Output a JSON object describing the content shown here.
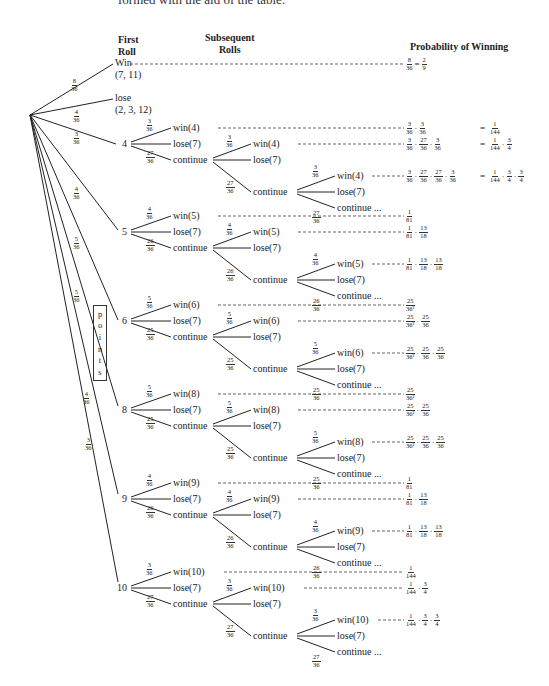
{
  "caption_fragment": "formed with the aid of the table.",
  "headers": {
    "first_roll": [
      "First",
      "Roll"
    ],
    "subsequent_rolls": [
      "Subsequent",
      "Rolls"
    ],
    "probability": "Probability of Winning"
  },
  "root_branches": [
    {
      "label": "Win",
      "sub": "(7, 11)",
      "p": [
        "8",
        "36"
      ],
      "result": {
        "frac": [
          [
            "8",
            "36"
          ]
        ],
        "eq": [
          "2",
          "9"
        ]
      }
    },
    {
      "label": "lose",
      "sub": "(2, 3, 12)",
      "p": [
        "4",
        "36"
      ]
    },
    {
      "label": "4",
      "p": [
        "3",
        "36"
      ]
    },
    {
      "label": "5",
      "p": [
        "4",
        "36"
      ]
    },
    {
      "label": "6",
      "p": [
        "5",
        "36"
      ]
    },
    {
      "label": "8",
      "p": [
        "5",
        "36"
      ]
    },
    {
      "label": "9",
      "p": [
        "4",
        "36"
      ]
    },
    {
      "label": "10",
      "p": [
        "3",
        "36"
      ]
    }
  ],
  "points_label": [
    "p",
    "o",
    "i",
    "n",
    "t",
    "s"
  ],
  "point_trees": [
    {
      "point": "4",
      "win": "win(4)",
      "lose": "lose(7)",
      "cont": "continue",
      "cont_more": "continue ...",
      "pw": [
        "3",
        "36"
      ],
      "pl": [
        "6",
        "36"
      ],
      "pc": [
        "27",
        "36"
      ],
      "probs": [
        {
          "terms": [
            [
              "3",
              "36"
            ],
            [
              "3",
              "36"
            ]
          ],
          "eq": [
            [
              "1",
              "144"
            ]
          ]
        },
        {
          "terms": [
            [
              "3",
              "36"
            ],
            [
              "27",
              "36"
            ],
            [
              "3",
              "36"
            ]
          ],
          "eq": [
            [
              "1",
              "144"
            ],
            [
              "3",
              "4"
            ]
          ]
        },
        {
          "terms": [
            [
              "3",
              "36"
            ],
            [
              "27",
              "36"
            ],
            [
              "27",
              "36"
            ],
            [
              "3",
              "36"
            ]
          ],
          "eq": [
            [
              "1",
              "144"
            ],
            [
              "3",
              "4"
            ],
            [
              "3",
              "4"
            ]
          ]
        }
      ]
    },
    {
      "point": "5",
      "win": "win(5)",
      "lose": "lose(7)",
      "cont": "continue",
      "cont_more": "continue ...",
      "pw": [
        "4",
        "36"
      ],
      "pl": [
        "6",
        "36"
      ],
      "pc": [
        "26",
        "36"
      ],
      "probs": [
        {
          "terms": [
            [
              "1",
              "81"
            ]
          ]
        },
        {
          "terms": [
            [
              "1",
              "81"
            ],
            [
              "13",
              "18"
            ]
          ]
        },
        {
          "terms": [
            [
              "1",
              "81"
            ],
            [
              "13",
              "18"
            ],
            [
              "13",
              "18"
            ]
          ]
        }
      ]
    },
    {
      "point": "6",
      "win": "win(6)",
      "lose": "lose(7)",
      "cont": "continue",
      "cont_more": "continue ...",
      "pw": [
        "5",
        "36"
      ],
      "pl": [
        "6",
        "36"
      ],
      "pc": [
        "25",
        "36"
      ],
      "probs": [
        {
          "terms": [
            [
              "25",
              "36²"
            ]
          ]
        },
        {
          "terms": [
            [
              "25",
              "36²"
            ],
            [
              "25",
              "36"
            ]
          ]
        },
        {
          "terms": [
            [
              "25",
              "36²"
            ],
            [
              "25",
              "36"
            ],
            [
              "25",
              "36"
            ]
          ]
        }
      ]
    },
    {
      "point": "8",
      "win": "win(8)",
      "lose": "lose(7)",
      "cont": "continue",
      "cont_more": "continue ...",
      "pw": [
        "5",
        "36"
      ],
      "pl": [
        "6",
        "36"
      ],
      "pc": [
        "25",
        "36"
      ],
      "probs": [
        {
          "terms": [
            [
              "25",
              "36²"
            ]
          ]
        },
        {
          "terms": [
            [
              "25",
              "36²"
            ],
            [
              "25",
              "36"
            ]
          ]
        },
        {
          "terms": [
            [
              "25",
              "36²"
            ],
            [
              "25",
              "36"
            ],
            [
              "25",
              "36"
            ]
          ]
        }
      ]
    },
    {
      "point": "9",
      "win": "win(9)",
      "lose": "lose(7)",
      "cont": "continue",
      "cont_more": "continue ...",
      "pw": [
        "4",
        "36"
      ],
      "pl": [
        "6",
        "36"
      ],
      "pc": [
        "26",
        "36"
      ],
      "probs": [
        {
          "terms": [
            [
              "1",
              "81"
            ]
          ]
        },
        {
          "terms": [
            [
              "1",
              "81"
            ],
            [
              "13",
              "18"
            ]
          ]
        },
        {
          "terms": [
            [
              "1",
              "81"
            ],
            [
              "13",
              "18"
            ],
            [
              "13",
              "18"
            ]
          ]
        }
      ]
    },
    {
      "point": "10",
      "win": "win(10)",
      "lose": "lose(7)",
      "cont": "continue",
      "cont_more": "continue ...",
      "pw": [
        "3",
        "36"
      ],
      "pl": [
        "6",
        "36"
      ],
      "pc": [
        "27",
        "36"
      ],
      "probs": [
        {
          "terms": [
            [
              "1",
              "144"
            ]
          ]
        },
        {
          "terms": [
            [
              "1",
              "144"
            ],
            [
              "3",
              "4"
            ]
          ]
        },
        {
          "terms": [
            [
              "1",
              "144"
            ],
            [
              "3",
              "4"
            ],
            [
              "3",
              "4"
            ]
          ]
        }
      ]
    }
  ]
}
